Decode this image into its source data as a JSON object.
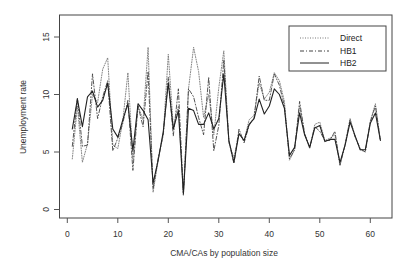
{
  "chart_data": {
    "type": "line",
    "title": "",
    "xlabel": "CMA/CAs by population size",
    "ylabel": "Unemployment rate",
    "xlim": [
      0,
      64
    ],
    "ylim": [
      -0.5,
      17
    ],
    "x_ticks": [
      0,
      10,
      20,
      30,
      40,
      50,
      60
    ],
    "y_ticks": [
      0,
      5,
      10,
      15
    ],
    "grid": false,
    "legend_position": "top-right",
    "x": [
      1,
      2,
      3,
      4,
      5,
      6,
      7,
      8,
      9,
      10,
      11,
      12,
      13,
      14,
      15,
      16,
      17,
      18,
      19,
      20,
      21,
      22,
      23,
      24,
      25,
      26,
      27,
      28,
      29,
      30,
      31,
      32,
      33,
      34,
      35,
      36,
      37,
      38,
      39,
      40,
      41,
      42,
      43,
      44,
      45,
      46,
      47,
      48,
      49,
      50,
      51,
      52,
      53,
      54,
      55,
      56,
      57,
      58,
      59,
      60,
      61,
      62
    ],
    "series": [
      {
        "name": "Direct",
        "style": "dotted",
        "color": "#777777",
        "values": [
          4.4,
          9.0,
          4.1,
          5.7,
          10.0,
          9.3,
          12.2,
          13.2,
          5.6,
          5.3,
          7.7,
          11.9,
          4.4,
          9.0,
          7.8,
          14.1,
          1.5,
          4.3,
          6.6,
          13.5,
          7.2,
          9.0,
          1.2,
          10.5,
          14.1,
          12.0,
          8.0,
          10.0,
          6.5,
          10.6,
          13.8,
          5.8,
          4.5,
          6.6,
          6.0,
          7.8,
          8.2,
          11.0,
          9.6,
          10.2,
          11.9,
          11.2,
          9.4,
          4.3,
          5.2,
          9.0,
          6.6,
          5.3,
          7.4,
          7.6,
          6.0,
          6.2,
          6.5,
          3.8,
          5.7,
          7.9,
          6.4,
          5.2,
          5.0,
          7.7,
          9.2,
          6.0
        ]
      },
      {
        "name": "HB1",
        "style": "dashdot",
        "color": "#444444",
        "values": [
          5.5,
          9.7,
          5.5,
          5.6,
          11.8,
          7.9,
          9.8,
          11.2,
          5.1,
          6.2,
          7.5,
          9.5,
          3.4,
          9.0,
          7.2,
          12.0,
          1.8,
          4.5,
          6.5,
          11.5,
          6.4,
          10.5,
          1.3,
          10.5,
          9.8,
          8.0,
          6.5,
          11.5,
          5.1,
          7.3,
          13.0,
          5.9,
          4.0,
          7.0,
          5.8,
          7.3,
          8.0,
          11.6,
          9.5,
          9.5,
          11.8,
          10.8,
          9.0,
          4.4,
          5.2,
          9.4,
          6.6,
          5.4,
          7.2,
          6.8,
          6.0,
          6.0,
          6.8,
          3.9,
          5.6,
          7.8,
          6.3,
          5.3,
          5.0,
          7.6,
          9.0,
          6.0
        ]
      },
      {
        "name": "HB2",
        "style": "solid",
        "color": "#222222",
        "values": [
          7.0,
          9.6,
          7.2,
          9.8,
          10.3,
          8.9,
          9.5,
          11.0,
          7.0,
          6.3,
          7.8,
          9.2,
          5.1,
          9.2,
          8.6,
          7.8,
          2.3,
          4.3,
          6.8,
          11.0,
          7.0,
          8.6,
          1.4,
          8.8,
          8.6,
          7.4,
          7.4,
          8.4,
          7.0,
          7.9,
          11.8,
          6.0,
          4.1,
          6.6,
          6.0,
          7.4,
          7.9,
          9.6,
          8.3,
          9.0,
          10.5,
          10.0,
          8.8,
          4.7,
          5.4,
          8.4,
          6.5,
          5.4,
          7.1,
          7.3,
          5.9,
          6.1,
          6.1,
          4.1,
          5.6,
          7.6,
          6.4,
          5.2,
          5.2,
          7.5,
          8.4,
          6.0
        ]
      }
    ]
  },
  "legend": {
    "items": [
      {
        "label": "Direct"
      },
      {
        "label": "HB1"
      },
      {
        "label": "HB2"
      }
    ]
  },
  "axes": {
    "x_title": "CMA/CAs by population size",
    "y_title": "Unemployment rate"
  }
}
